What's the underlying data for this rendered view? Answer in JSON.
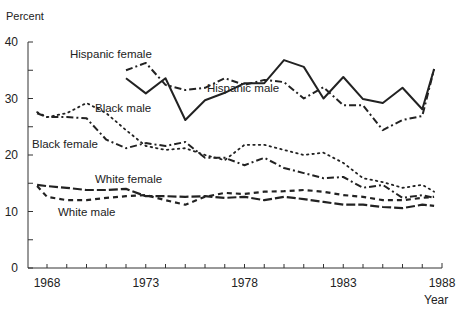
{
  "chart_data": {
    "type": "line",
    "title": "",
    "xlabel": "Year",
    "ylabel": "Percent",
    "xlim": [
      1967.5,
      1988
    ],
    "ylim": [
      0,
      40
    ],
    "grid": false,
    "legend_position": "inline labels",
    "x_ticks": [
      {
        "value": 1968,
        "label": "1968"
      },
      {
        "value": 1973,
        "label": "1973"
      },
      {
        "value": 1978,
        "label": "1978"
      },
      {
        "value": 1983,
        "label": "1983"
      },
      {
        "value": 1988,
        "label": "1988"
      }
    ],
    "y_ticks": [
      {
        "value": 0,
        "label": "0"
      },
      {
        "value": 10,
        "label": "10"
      },
      {
        "value": 20,
        "label": "20"
      },
      {
        "value": 30,
        "label": "30"
      },
      {
        "value": 40,
        "label": "40"
      }
    ],
    "series": [
      {
        "name": "Hispanic male",
        "style": "solid",
        "x": [
          1972,
          1973,
          1974,
          1975,
          1976,
          1977,
          1978,
          1979,
          1980,
          1981,
          1982,
          1983,
          1984,
          1985,
          1986,
          1987,
          1987.6
        ],
        "values": [
          33.6,
          30.9,
          33.6,
          26.2,
          29.7,
          31.0,
          32.7,
          32.7,
          36.8,
          35.6,
          30.0,
          33.8,
          29.9,
          29.2,
          31.9,
          28.1,
          35.2
        ],
        "label": {
          "text": "Hispanic male",
          "x": 207,
          "y": 92
        }
      },
      {
        "name": "Hispanic female",
        "style": "dashdot",
        "x": [
          1972,
          1973,
          1974,
          1975,
          1976,
          1977,
          1978,
          1979,
          1980,
          1981,
          1982,
          1983,
          1984,
          1985,
          1986,
          1987,
          1987.6
        ],
        "values": [
          35.0,
          36.3,
          32.4,
          31.5,
          31.9,
          33.6,
          32.4,
          33.3,
          32.9,
          30.0,
          32.0,
          28.8,
          28.8,
          24.4,
          26.2,
          26.9,
          35.2
        ],
        "label": {
          "text": "Hispanic female",
          "x": 70,
          "y": 58
        }
      },
      {
        "name": "Black male",
        "style": "dotted",
        "x": [
          1967.5,
          1968,
          1969,
          1970,
          1971,
          1972,
          1973,
          1974,
          1975,
          1976,
          1977,
          1978,
          1979,
          1980,
          1981,
          1982,
          1983,
          1984,
          1985,
          1986,
          1987,
          1987.6
        ],
        "values": [
          27.6,
          26.7,
          27.4,
          29.2,
          27.4,
          24.4,
          21.6,
          20.9,
          21.2,
          20.0,
          19.1,
          21.8,
          21.8,
          20.9,
          20.0,
          20.4,
          18.6,
          15.9,
          15.2,
          14.2,
          14.7,
          13.5
        ],
        "label": {
          "text": "Black male",
          "x": 95,
          "y": 112
        }
      },
      {
        "name": "Black female",
        "style": "dashdot",
        "x": [
          1967.5,
          1968,
          1969,
          1970,
          1971,
          1972,
          1973,
          1974,
          1975,
          1976,
          1977,
          1978,
          1979,
          1980,
          1981,
          1982,
          1983,
          1984,
          1985,
          1986,
          1987,
          1987.6
        ],
        "values": [
          27.4,
          26.7,
          26.7,
          26.5,
          22.7,
          21.2,
          22.1,
          21.6,
          22.3,
          19.5,
          19.5,
          18.2,
          19.5,
          17.7,
          16.8,
          15.9,
          16.1,
          14.2,
          14.7,
          12.4,
          12.9,
          12.4
        ],
        "label": {
          "text": "Black female",
          "x": 32,
          "y": 148
        }
      },
      {
        "name": "White female",
        "style": "longdash",
        "x": [
          1967.5,
          1968,
          1969,
          1970,
          1971,
          1972,
          1973,
          1974,
          1975,
          1976,
          1977,
          1978,
          1979,
          1980,
          1981,
          1982,
          1983,
          1984,
          1985,
          1986,
          1987,
          1987.6
        ],
        "values": [
          14.7,
          14.5,
          14.2,
          13.8,
          13.8,
          14.0,
          12.7,
          12.7,
          12.6,
          12.7,
          12.4,
          12.6,
          12.0,
          12.6,
          12.2,
          11.7,
          11.2,
          11.2,
          10.8,
          10.6,
          11.2,
          11.0
        ],
        "label": {
          "text": "White female",
          "x": 95,
          "y": 183
        }
      },
      {
        "name": "White male",
        "style": "shortdash",
        "x": [
          1967.5,
          1968,
          1969,
          1970,
          1971,
          1972,
          1973,
          1974,
          1975,
          1976,
          1977,
          1978,
          1979,
          1980,
          1981,
          1982,
          1983,
          1984,
          1985,
          1986,
          1987,
          1987.6
        ],
        "values": [
          14.5,
          12.6,
          12.0,
          12.0,
          12.4,
          12.7,
          12.9,
          12.0,
          11.2,
          12.6,
          13.3,
          13.1,
          13.5,
          13.6,
          13.8,
          13.5,
          12.9,
          12.6,
          12.0,
          12.0,
          12.4,
          12.6
        ],
        "label": {
          "text": "White male",
          "x": 58,
          "y": 216
        }
      }
    ]
  }
}
